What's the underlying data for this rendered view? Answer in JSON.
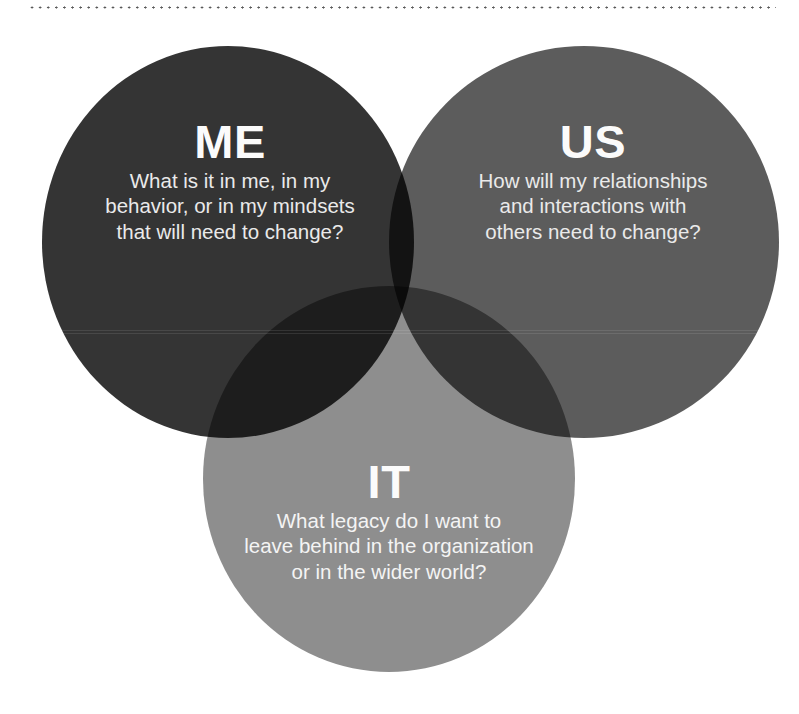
{
  "diagram": {
    "type": "venn",
    "background_color": "#ffffff",
    "text_color": "#f2f2f2",
    "separator": {
      "style": "dotted",
      "color": "#3a3a3a"
    },
    "circles": [
      {
        "id": "me",
        "title": "ME",
        "body": "What is it in me, in my behavior, or in my mindsets that will need to change?",
        "body_lines": [
          "What is it in me, in my",
          "behavior, or in my mindsets",
          "that will need to change?"
        ],
        "color": "#343434",
        "position": "top-left"
      },
      {
        "id": "us",
        "title": "US",
        "body": "How will my relationships and interactions with others need to change?",
        "body_lines": [
          "How will my relationships",
          "and interactions with",
          "others need to change?"
        ],
        "color": "#5c5c5c",
        "position": "top-right"
      },
      {
        "id": "it",
        "title": "IT",
        "body": "What legacy do I want to leave behind in the organization or in the wider world?",
        "body_lines": [
          "What legacy do I want to",
          "leave behind in the organization",
          "or in the wider world?"
        ],
        "color": "#8e8e8e",
        "position": "bottom-center"
      }
    ]
  }
}
